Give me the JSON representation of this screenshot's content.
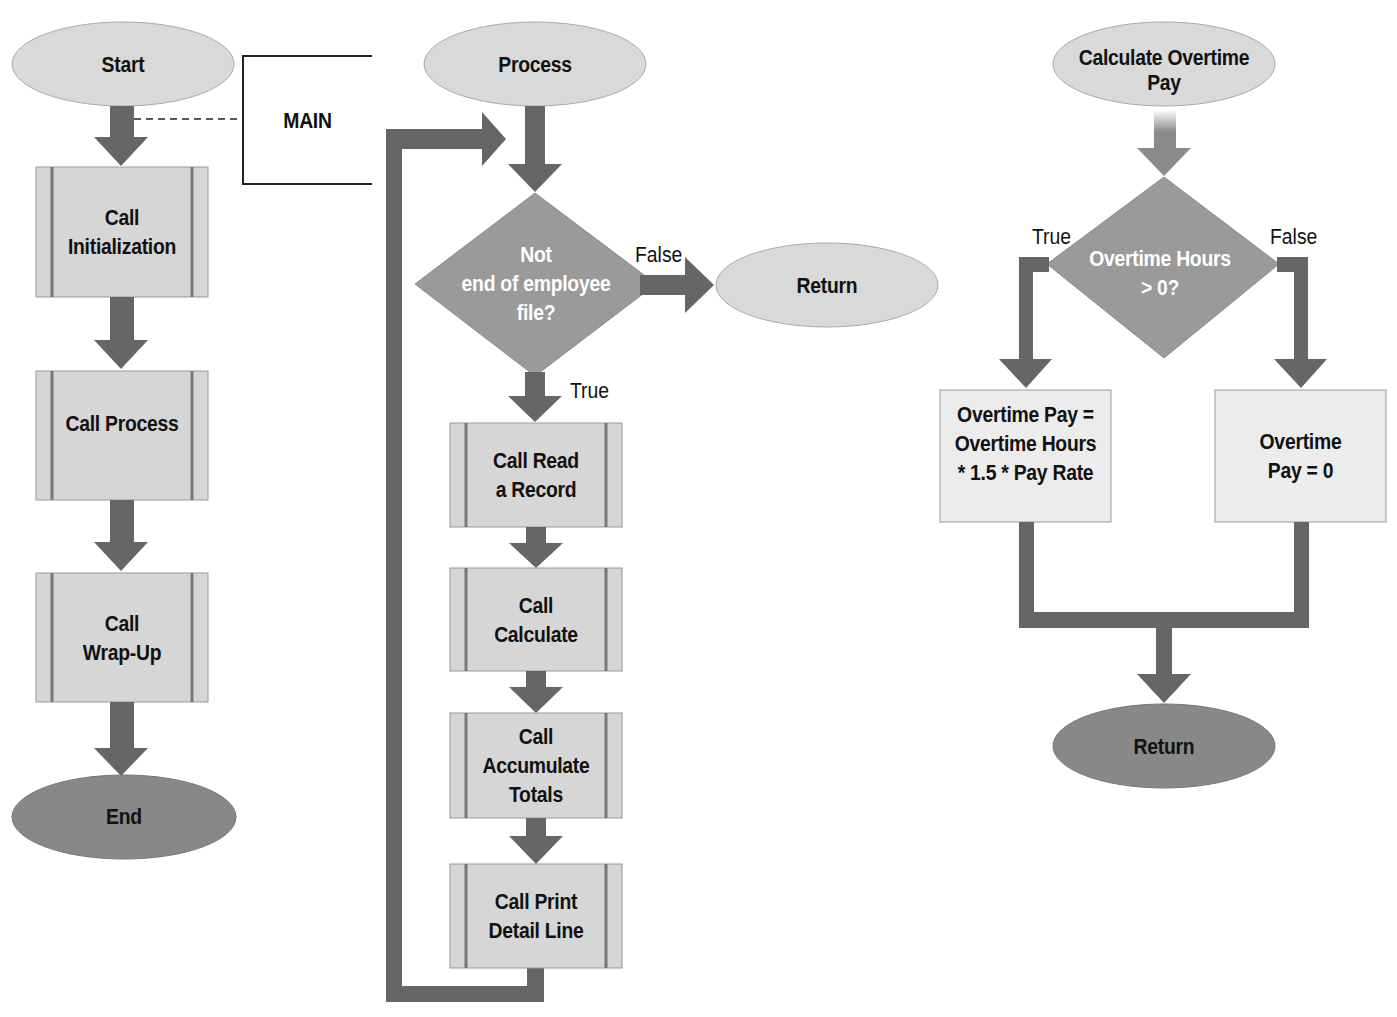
{
  "colors": {
    "arrow": "#666666",
    "arrow_light": "#8a8a8a",
    "terminal_light": "#d9d9d9",
    "terminal_dark": "#888888",
    "process_fill": "#d6d6d6",
    "process_stripe": "#777777",
    "decision_fill": "#9a9a9a",
    "box_fill": "#ececec",
    "text": "#111111"
  },
  "main": {
    "bracket_label": "MAIN",
    "start": "Start",
    "steps": [
      {
        "line1": "Call",
        "line2": "Initialization"
      },
      {
        "line1": "Call Process",
        "line2": ""
      },
      {
        "line1": "Call",
        "line2": "Wrap-Up"
      }
    ],
    "end": "End"
  },
  "process": {
    "start": "Process",
    "decision": {
      "line1": "Not",
      "line2": "end of employee",
      "line3": "file?"
    },
    "false_label": "False",
    "true_label": "True",
    "return": "Return",
    "steps": [
      {
        "line1": "Call Read",
        "line2": "a Record",
        "line3": ""
      },
      {
        "line1": "Call",
        "line2": "Calculate",
        "line3": ""
      },
      {
        "line1": "Call",
        "line2": "Accumulate",
        "line3": "Totals"
      },
      {
        "line1": "Call Print",
        "line2": "Detail Line",
        "line3": ""
      }
    ]
  },
  "overtime": {
    "start": {
      "line1": "Calculate Overtime",
      "line2": "Pay"
    },
    "decision": {
      "line1": "Overtime Hours",
      "line2": "> 0?"
    },
    "true_label": "True",
    "false_label": "False",
    "true_box": {
      "line1": "Overtime Pay =",
      "line2": "Overtime Hours",
      "line3": "* 1.5 * Pay Rate"
    },
    "false_box": {
      "line1": "Overtime",
      "line2": "Pay = 0"
    },
    "return": "Return"
  }
}
